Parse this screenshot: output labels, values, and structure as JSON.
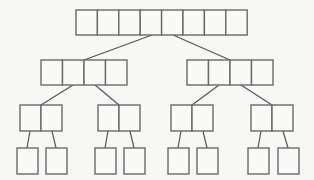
{
  "diagram": {
    "type": "tree",
    "colors": {
      "background": "#f7f7f5",
      "cell_fill": "#f9f9f7",
      "cell_stroke": "#6a6a6a",
      "edge": "#555555"
    },
    "levels": [
      {
        "level": 0,
        "nodes": [
          {
            "id": "root",
            "x": 76,
            "y": 10,
            "cells": 8,
            "cell_w": 21.4,
            "cell_h": 25
          }
        ]
      },
      {
        "level": 1,
        "nodes": [
          {
            "id": "L",
            "x": 41,
            "y": 60,
            "cells": 4,
            "cell_w": 21.5,
            "cell_h": 25
          },
          {
            "id": "R",
            "x": 187,
            "y": 60,
            "cells": 4,
            "cell_w": 21.5,
            "cell_h": 25
          }
        ]
      },
      {
        "level": 2,
        "nodes": [
          {
            "id": "LL",
            "x": 20,
            "y": 105,
            "cells": 2,
            "cell_w": 21,
            "cell_h": 26
          },
          {
            "id": "LR",
            "x": 98,
            "y": 105,
            "cells": 2,
            "cell_w": 21,
            "cell_h": 26
          },
          {
            "id": "RL",
            "x": 171,
            "y": 105,
            "cells": 2,
            "cell_w": 21,
            "cell_h": 26
          },
          {
            "id": "RR",
            "x": 251,
            "y": 105,
            "cells": 2,
            "cell_w": 21,
            "cell_h": 26
          }
        ]
      },
      {
        "level": 3,
        "nodes": [
          {
            "id": "LL1",
            "x": 17,
            "y": 148,
            "cells": 1,
            "cell_w": 21,
            "cell_h": 26
          },
          {
            "id": "LL2",
            "x": 46,
            "y": 148,
            "cells": 1,
            "cell_w": 21,
            "cell_h": 26
          },
          {
            "id": "LR1",
            "x": 95,
            "y": 148,
            "cells": 1,
            "cell_w": 21,
            "cell_h": 26
          },
          {
            "id": "LR2",
            "x": 124,
            "y": 148,
            "cells": 1,
            "cell_w": 21,
            "cell_h": 26
          },
          {
            "id": "RL1",
            "x": 168,
            "y": 148,
            "cells": 1,
            "cell_w": 21,
            "cell_h": 26
          },
          {
            "id": "RL2",
            "x": 197,
            "y": 148,
            "cells": 1,
            "cell_w": 21,
            "cell_h": 26
          },
          {
            "id": "RR1",
            "x": 248,
            "y": 148,
            "cells": 1,
            "cell_w": 21,
            "cell_h": 26
          },
          {
            "id": "RR2",
            "x": 278,
            "y": 148,
            "cells": 1,
            "cell_w": 21,
            "cell_h": 26
          }
        ]
      }
    ],
    "edges": [
      {
        "from": "root",
        "to": "L",
        "x1": 152,
        "y1": 35,
        "x2": 84,
        "y2": 60
      },
      {
        "from": "root",
        "to": "R",
        "x1": 173,
        "y1": 35,
        "x2": 230,
        "y2": 60
      },
      {
        "from": "L",
        "to": "LL",
        "x1": 73,
        "y1": 85,
        "x2": 41,
        "y2": 105
      },
      {
        "from": "L",
        "to": "LR",
        "x1": 95,
        "y1": 85,
        "x2": 119,
        "y2": 105
      },
      {
        "from": "R",
        "to": "RL",
        "x1": 219,
        "y1": 85,
        "x2": 192,
        "y2": 105
      },
      {
        "from": "R",
        "to": "RR",
        "x1": 241,
        "y1": 85,
        "x2": 272,
        "y2": 105
      },
      {
        "from": "LL",
        "to": "LL1",
        "x1": 30,
        "y1": 131,
        "x2": 27,
        "y2": 148
      },
      {
        "from": "LL",
        "to": "LL2",
        "x1": 52,
        "y1": 131,
        "x2": 56,
        "y2": 148
      },
      {
        "from": "LR",
        "to": "LR1",
        "x1": 108,
        "y1": 131,
        "x2": 105,
        "y2": 148
      },
      {
        "from": "LR",
        "to": "LR2",
        "x1": 130,
        "y1": 131,
        "x2": 134,
        "y2": 148
      },
      {
        "from": "RL",
        "to": "RL1",
        "x1": 181,
        "y1": 131,
        "x2": 178,
        "y2": 148
      },
      {
        "from": "RL",
        "to": "RL2",
        "x1": 203,
        "y1": 131,
        "x2": 207,
        "y2": 148
      },
      {
        "from": "RR",
        "to": "RR1",
        "x1": 261,
        "y1": 131,
        "x2": 258,
        "y2": 148
      },
      {
        "from": "RR",
        "to": "RR2",
        "x1": 283,
        "y1": 131,
        "x2": 288,
        "y2": 148
      }
    ]
  }
}
